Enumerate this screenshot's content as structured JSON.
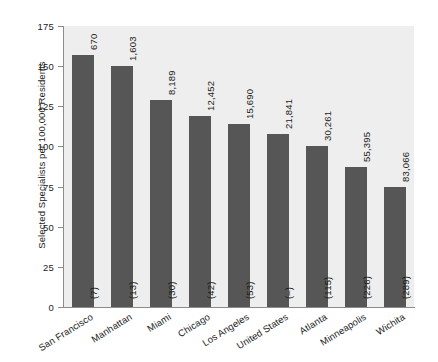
{
  "chart_data": {
    "type": "bar",
    "title": "",
    "subtitle": "",
    "xlabel": "",
    "ylabel": "Selected Specialists per 100,000 Residents",
    "ylim": [
      0,
      175
    ],
    "yticks": [
      0,
      25,
      50,
      75,
      100,
      125,
      150,
      175
    ],
    "grid": false,
    "legend": "none",
    "bar_color": "#565656",
    "plot_background": "#eeeeee",
    "categories": [
      "San Francisco",
      "Manhattan",
      "Miami",
      "Chicago",
      "Los Angeles",
      "United States",
      "Atlanta",
      "Minneapolis",
      "Wichita"
    ],
    "values": [
      157,
      150,
      129,
      119,
      114,
      108,
      100,
      87,
      75
    ],
    "bar_top_labels": [
      "670",
      "1,603",
      "8,189",
      "12,452",
      "15,690",
      "21,841",
      "30,261",
      "55,395",
      "83,066"
    ],
    "bar_inside_labels": [
      "(7)",
      "(13)",
      "(30)",
      "(42)",
      "(53)",
      "(–)",
      "(115)",
      "(226)",
      "(289)"
    ]
  }
}
